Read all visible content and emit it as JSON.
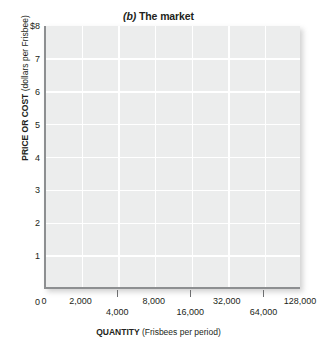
{
  "chart_data": {
    "type": "line",
    "title_paren_letter": "(b)",
    "title_rest": "The market",
    "xlabel": "QUANTITY",
    "xlabel_unit": "(Frisbees per period)",
    "ylabel": "PRICE OR COST",
    "ylabel_unit": "(dollars per Frisbee)",
    "grid": true,
    "legend": "none",
    "series": [],
    "y_axis": {
      "min": 0,
      "max": 8,
      "scale": "linear",
      "ticks": [
        {
          "value": 8,
          "label": "$8"
        },
        {
          "value": 7,
          "label": "7"
        },
        {
          "value": 6,
          "label": "6"
        },
        {
          "value": 5,
          "label": "5"
        },
        {
          "value": 4,
          "label": "4"
        },
        {
          "value": 3,
          "label": "3"
        },
        {
          "value": 2,
          "label": "2"
        },
        {
          "value": 1,
          "label": "1"
        },
        {
          "value": 0,
          "label": "0"
        }
      ]
    },
    "x_axis": {
      "scale": "log2",
      "min": 1000,
      "max": 128000,
      "origin_label": "0",
      "ticks": [
        {
          "value": 2000,
          "label": "2,000",
          "row": 0,
          "tick_mark": false
        },
        {
          "value": 4000,
          "label": "4,000",
          "row": 1,
          "tick_mark": true
        },
        {
          "value": 8000,
          "label": "8,000",
          "row": 0,
          "tick_mark": false
        },
        {
          "value": 16000,
          "label": "16,000",
          "row": 1,
          "tick_mark": true
        },
        {
          "value": 32000,
          "label": "32,000",
          "row": 0,
          "tick_mark": false
        },
        {
          "value": 64000,
          "label": "64,000",
          "row": 1,
          "tick_mark": true
        },
        {
          "value": 128000,
          "label": "128,000",
          "row": 0,
          "tick_mark": false
        }
      ]
    },
    "colors": {
      "panel_fill": "#eceded",
      "gridline": "#ffffff",
      "axis_line": "#8d8f91",
      "tick_mark": "#6d6e70",
      "text": "#231f20",
      "background": "#ffffff"
    }
  }
}
